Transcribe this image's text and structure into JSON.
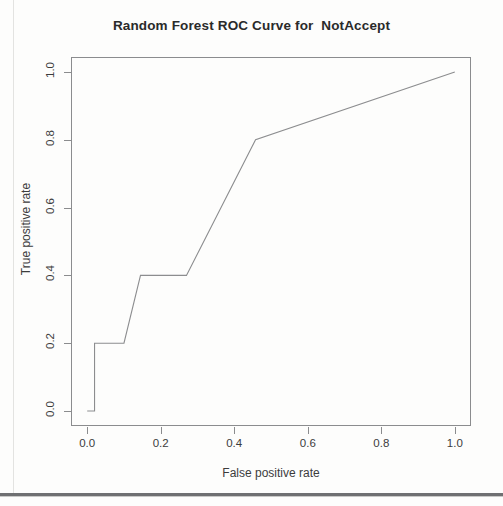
{
  "chart_data": {
    "type": "line",
    "title": "Random Forest ROC Curve for  NotAccept",
    "xlabel": "False positive rate",
    "ylabel": "True positive rate",
    "xlim": [
      0.0,
      1.0
    ],
    "ylim": [
      0.0,
      1.0
    ],
    "grid": false,
    "legend": null,
    "xticks": [
      "0.0",
      "0.2",
      "0.4",
      "0.6",
      "0.8",
      "1.0"
    ],
    "xtick_values": [
      0.0,
      0.2,
      0.4,
      0.6,
      0.8,
      1.0
    ],
    "yticks": [
      "0.0",
      "0.2",
      "0.4",
      "0.6",
      "0.8",
      "1.0"
    ],
    "ytick_values": [
      0.0,
      0.2,
      0.4,
      0.6,
      0.8,
      1.0
    ],
    "series": [
      {
        "name": "ROC curve",
        "color": "#8c8d8f",
        "x": [
          0.0,
          0.02,
          0.02,
          0.1,
          0.145,
          0.27,
          0.458,
          1.0
        ],
        "y": [
          0.0,
          0.0,
          0.2,
          0.2,
          0.4,
          0.4,
          0.8,
          1.0
        ]
      }
    ]
  },
  "figure": {
    "title": "Random Forest ROC Curve for  NotAccept",
    "axis_x_title": "False positive rate",
    "axis_y_title": "True positive rate"
  },
  "colors": {
    "curve": "#8c8d8f",
    "frame": "#8b8c8e",
    "text": "#3c3c3c",
    "title": "#2a2a2a",
    "page_background": "#fdfdfc",
    "rule": "#6f7072"
  }
}
